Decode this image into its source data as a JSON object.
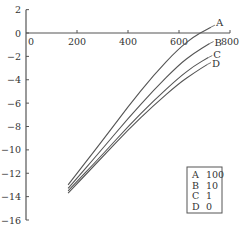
{
  "chart_data": {
    "type": "line",
    "title": "",
    "xlabel": "",
    "ylabel": "",
    "xlim": [
      0,
      800
    ],
    "ylim": [
      -16,
      2
    ],
    "x_ticks": [
      0,
      200,
      400,
      600,
      800
    ],
    "y_ticks": [
      2,
      0,
      -2,
      -4,
      -6,
      -8,
      -10,
      -12,
      -14,
      -16
    ],
    "x_tick_labels": [
      "0",
      "200",
      "400",
      "600",
      "800"
    ],
    "y_tick_labels": [
      "2",
      "0",
      "−2",
      "−4",
      "−6",
      "−8",
      "−10",
      "−12",
      "−14",
      "−16"
    ],
    "grid": false,
    "legend_position": "lower right",
    "series": [
      {
        "name": "A",
        "param": "100",
        "points": [
          [
            165,
            -13.0
          ],
          [
            300,
            -9.2
          ],
          [
            400,
            -6.3
          ],
          [
            500,
            -3.6
          ],
          [
            600,
            -1.3
          ],
          [
            660,
            -0.3
          ],
          [
            700,
            0.2
          ],
          [
            725,
            0.5
          ]
        ]
      },
      {
        "name": "B",
        "param": "10",
        "points": [
          [
            165,
            -13.3
          ],
          [
            300,
            -9.9
          ],
          [
            400,
            -7.3
          ],
          [
            500,
            -4.9
          ],
          [
            600,
            -2.7
          ],
          [
            660,
            -1.7
          ],
          [
            720,
            -0.9
          ]
        ]
      },
      {
        "name": "C",
        "param": "1",
        "points": [
          [
            165,
            -13.5
          ],
          [
            300,
            -10.4
          ],
          [
            400,
            -8.0
          ],
          [
            500,
            -5.8
          ],
          [
            600,
            -3.8
          ],
          [
            660,
            -2.8
          ],
          [
            715,
            -2.1
          ]
        ]
      },
      {
        "name": "D",
        "param": "0",
        "points": [
          [
            165,
            -13.7
          ],
          [
            300,
            -10.6
          ],
          [
            400,
            -8.3
          ],
          [
            500,
            -6.2
          ],
          [
            600,
            -4.3
          ],
          [
            660,
            -3.4
          ],
          [
            710,
            -2.7
          ]
        ]
      }
    ],
    "legend": [
      {
        "key": "A",
        "value": "100"
      },
      {
        "key": "B",
        "value": "10"
      },
      {
        "key": "C",
        "value": "1"
      },
      {
        "key": "D",
        "value": "0"
      }
    ]
  }
}
